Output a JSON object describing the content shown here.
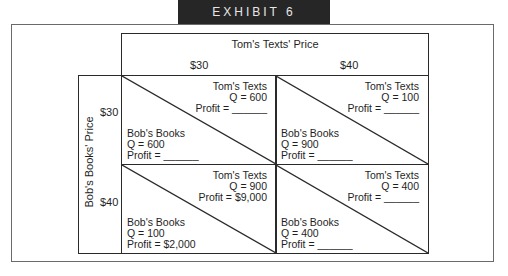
{
  "banner": {
    "title": "EXHIBIT 6"
  },
  "matrix": {
    "column_player_title": "Tom's Texts' Price",
    "column_labels": [
      "$30",
      "$40"
    ],
    "row_player_title": "Bob's Books' Price",
    "row_labels": [
      "$30",
      "$40"
    ],
    "cells": [
      {
        "tom": {
          "name": "Tom's Texts",
          "q": "Q = 600",
          "profit": "Profit = ______"
        },
        "bob": {
          "name": "Bob's Books",
          "q": "Q = 600",
          "profit": "Profit = ______"
        }
      },
      {
        "tom": {
          "name": "Tom's Texts",
          "q": "Q = 100",
          "profit": "Profit = ______"
        },
        "bob": {
          "name": "Bob's Books",
          "q": "Q = 900",
          "profit": "Profit = ______"
        }
      },
      {
        "tom": {
          "name": "Tom's Texts",
          "q": "Q = 900",
          "profit": "Profit = $9,000"
        },
        "bob": {
          "name": "Bob's Books",
          "q": "Q = 100",
          "profit": "Profit = $2,000"
        }
      },
      {
        "tom": {
          "name": "Tom's Texts",
          "q": "Q = 400",
          "profit": "Profit = ______"
        },
        "bob": {
          "name": "Bob's Books",
          "q": "Q = 400",
          "profit": "Profit = ______"
        }
      }
    ]
  }
}
